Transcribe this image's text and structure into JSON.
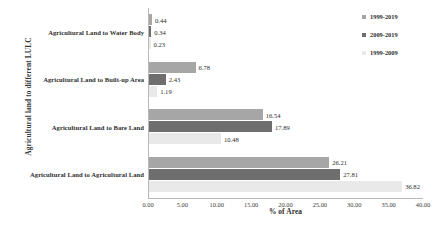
{
  "chart_data": {
    "type": "bar",
    "orientation": "horizontal",
    "title": "",
    "xlabel": "% of Area",
    "ylabel": "Agricultural land to different LULC",
    "xlim": [
      0,
      40
    ],
    "xticks": [
      "0.00",
      "5.00",
      "10.00",
      "15.00",
      "20.00",
      "25.00",
      "30.00",
      "35.00",
      "40.00"
    ],
    "grid": false,
    "legend_position": "top-right",
    "categories": [
      "Agricultural Land to Water Body",
      "Agricultural Land to Built-up Area",
      "Agricultural Land to Bare Land",
      "Agricultural Land to Agricultural Land"
    ],
    "series": [
      {
        "name": "1999-2019",
        "color": "#a6a6a6",
        "values": [
          0.44,
          6.78,
          16.54,
          26.21
        ],
        "labels": [
          "0.44",
          "6.78",
          "16.54",
          "26.21"
        ]
      },
      {
        "name": "2009-2019",
        "color": "#6e6e6e",
        "values": [
          0.34,
          2.43,
          17.89,
          27.81
        ],
        "labels": [
          "0.34",
          "2.43",
          "17.89",
          "27.81"
        ]
      },
      {
        "name": "1999-2009",
        "color": "#e9e9e9",
        "values": [
          0.23,
          1.19,
          10.48,
          36.82
        ],
        "labels": [
          "0.23",
          "1.19",
          "10.48",
          "36.82"
        ]
      }
    ]
  },
  "legend": {
    "items": [
      {
        "label": "1999-2019",
        "color": "#a6a6a6"
      },
      {
        "label": "2009-2019",
        "color": "#6e6e6e"
      },
      {
        "label": "1999-2009",
        "color": "#e9e9e9"
      }
    ]
  },
  "axes": {
    "x_title": "% of Area",
    "y_title": "Agricultural land to different LULC"
  }
}
